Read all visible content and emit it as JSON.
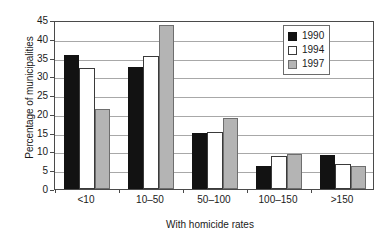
{
  "chart_data": {
    "type": "bar",
    "title": "",
    "xlabel": "With homicide rates",
    "ylabel": "Percentage of municipalities",
    "categories": [
      "<10",
      "10–50",
      "50–100",
      "100–150",
      ">150"
    ],
    "series": [
      {
        "name": "1990",
        "color": "#121212",
        "values": [
          35.8,
          32.5,
          14.8,
          6.1,
          9.1
        ]
      },
      {
        "name": "1994",
        "color": "#ffffff",
        "values": [
          32.3,
          35.3,
          15.3,
          8.8,
          6.6
        ]
      },
      {
        "name": "1997",
        "color": "#b4b4b4",
        "values": [
          21.3,
          43.7,
          18.9,
          9.4,
          6.0
        ]
      }
    ],
    "ylim": [
      0,
      45
    ],
    "ytick_values": [
      0,
      5,
      10,
      15,
      20,
      25,
      30,
      35,
      40,
      45
    ],
    "ytick_labels": [
      "0",
      "5",
      "10",
      "15",
      "20",
      "25",
      "30",
      "35",
      "40",
      "45"
    ],
    "grid": "horizontal",
    "legend_position": "top-right",
    "legend_entries": [
      "1990",
      "1994",
      "1997"
    ]
  }
}
